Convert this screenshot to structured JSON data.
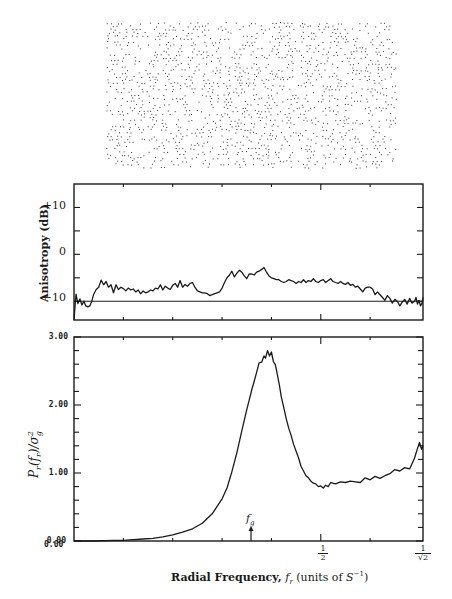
{
  "figure": {
    "pattern_panel": {
      "description": "blue-noise halftone dot pattern",
      "x": 106,
      "y": 22,
      "width": 290,
      "height": 148
    }
  },
  "chart_data": [
    {
      "type": "line",
      "title": "",
      "ylabel": "Anisotropy (dB)",
      "xlabel": "",
      "ylim": [
        -14,
        15
      ],
      "xlim": [
        0,
        0.7071
      ],
      "yticks": [
        -10,
        -5,
        0,
        5,
        10
      ],
      "ytick_labels": [
        "+10",
        "0",
        "-10"
      ],
      "reference_line": -10,
      "grid": false,
      "series": [
        {
          "name": "anisotropy",
          "x": [
            0.0,
            0.004,
            0.008,
            0.012,
            0.016,
            0.02,
            0.024,
            0.028,
            0.032,
            0.036,
            0.04,
            0.045,
            0.05,
            0.055,
            0.06,
            0.065,
            0.07,
            0.075,
            0.08,
            0.085,
            0.09,
            0.095,
            0.1,
            0.105,
            0.11,
            0.115,
            0.12,
            0.125,
            0.13,
            0.135,
            0.14,
            0.145,
            0.15,
            0.155,
            0.16,
            0.165,
            0.17,
            0.175,
            0.18,
            0.185,
            0.19,
            0.195,
            0.2,
            0.205,
            0.21,
            0.215,
            0.22,
            0.225,
            0.23,
            0.235,
            0.24,
            0.245,
            0.25,
            0.255,
            0.26,
            0.265,
            0.27,
            0.275,
            0.28,
            0.285,
            0.29,
            0.295,
            0.3,
            0.305,
            0.31,
            0.315,
            0.32,
            0.325,
            0.33,
            0.335,
            0.34,
            0.345,
            0.35,
            0.355,
            0.36,
            0.365,
            0.37,
            0.375,
            0.38,
            0.385,
            0.39,
            0.395,
            0.4,
            0.405,
            0.41,
            0.415,
            0.42,
            0.425,
            0.43,
            0.435,
            0.44,
            0.445,
            0.45,
            0.455,
            0.46,
            0.465,
            0.47,
            0.475,
            0.48,
            0.485,
            0.49,
            0.495,
            0.5,
            0.505,
            0.51,
            0.515,
            0.52,
            0.525,
            0.53,
            0.535,
            0.54,
            0.545,
            0.55,
            0.555,
            0.56,
            0.565,
            0.57,
            0.575,
            0.58,
            0.585,
            0.59,
            0.595,
            0.6,
            0.605,
            0.61,
            0.615,
            0.62,
            0.625,
            0.63,
            0.635,
            0.64,
            0.645,
            0.65,
            0.655,
            0.66,
            0.665,
            0.67,
            0.675,
            0.68,
            0.685,
            0.69,
            0.693,
            0.696,
            0.699,
            0.702,
            0.705,
            0.707
          ],
          "values": [
            -14,
            -8.5,
            -10.5,
            -9.5,
            -10.8,
            -10,
            -11,
            -11.2,
            -11,
            -10,
            -8.5,
            -7.5,
            -7,
            -5.5,
            -6.5,
            -5.8,
            -7,
            -6.5,
            -8.2,
            -6.5,
            -7.5,
            -7,
            -7.3,
            -7.8,
            -7.2,
            -7.6,
            -7.4,
            -8,
            -7.6,
            -8.4,
            -7.8,
            -8.2,
            -8,
            -7.6,
            -7.8,
            -7.2,
            -7.4,
            -6.5,
            -7.6,
            -6.8,
            -7.2,
            -7.5,
            -6.6,
            -6.2,
            -7,
            -5.6,
            -7,
            -6.4,
            -6.8,
            -6.2,
            -6,
            -7,
            -7.8,
            -8,
            -8.2,
            -8.2,
            -8.4,
            -8.8,
            -8.6,
            -8.4,
            -8.2,
            -8,
            -7.2,
            -6,
            -5,
            -4.4,
            -3.6,
            -4.8,
            -4,
            -3.4,
            -3.8,
            -4.6,
            -5.2,
            -4.2,
            -4.2,
            -4.4,
            -3.8,
            -3.6,
            -3.2,
            -2.8,
            -3.8,
            -4.6,
            -5,
            -5.2,
            -5.4,
            -5.4,
            -5.8,
            -6,
            -5.8,
            -5.4,
            -5.6,
            -5.8,
            -6.2,
            -5.8,
            -6,
            -5.4,
            -6,
            -5.6,
            -5.8,
            -5.2,
            -5.8,
            -6,
            -5.6,
            -5.4,
            -6,
            -5.6,
            -5.2,
            -5.8,
            -6,
            -6.2,
            -5.8,
            -6.2,
            -6.4,
            -6,
            -6.6,
            -6.4,
            -7,
            -6.8,
            -7.4,
            -8,
            -7.2,
            -7,
            -7,
            -7.4,
            -8.6,
            -8,
            -8.6,
            -9.2,
            -9.8,
            -8.8,
            -9.4,
            -10.4,
            -9.6,
            -10,
            -11,
            -10.2,
            -9.6,
            -10.6,
            -9.4,
            -10.4,
            -10,
            -9.2,
            -10.6,
            -9.8,
            -11,
            -10.4,
            -9.2,
            -12.2,
            -14,
            -9.6,
            -10.4,
            -8.8,
            -10,
            -14
          ]
        }
      ]
    },
    {
      "type": "line",
      "title": "",
      "ylabel": "P_r(f_r)/σ_g²",
      "xlabel": "Radial Frequency, f_r (units of S^-1)",
      "ylim": [
        0,
        3
      ],
      "xlim": [
        0,
        0.7071
      ],
      "yticks": [
        0,
        0.2,
        0.4,
        0.6,
        0.8,
        1.0,
        1.2,
        1.4,
        1.6,
        1.8,
        2.0,
        2.2,
        2.4,
        2.6,
        2.8,
        3.0
      ],
      "ytick_labels": [
        "0.00",
        "1.00",
        "2.00",
        "3.00"
      ],
      "xtick_labels": [
        "0.00",
        "1/2",
        "1/√2"
      ],
      "annotations": [
        {
          "text": "f_g",
          "x": 0.3901,
          "arrow": true
        }
      ],
      "grid": false,
      "series": [
        {
          "name": "radial power spectrum",
          "x": [
            0.0,
            0.04,
            0.08,
            0.1,
            0.12,
            0.14,
            0.16,
            0.18,
            0.2,
            0.22,
            0.24,
            0.26,
            0.28,
            0.3,
            0.31,
            0.32,
            0.33,
            0.34,
            0.35,
            0.355,
            0.36,
            0.365,
            0.37,
            0.375,
            0.38,
            0.385,
            0.388,
            0.392,
            0.396,
            0.4,
            0.404,
            0.408,
            0.412,
            0.416,
            0.42,
            0.425,
            0.43,
            0.435,
            0.44,
            0.445,
            0.45,
            0.455,
            0.46,
            0.465,
            0.47,
            0.475,
            0.48,
            0.485,
            0.49,
            0.495,
            0.5,
            0.505,
            0.51,
            0.515,
            0.52,
            0.53,
            0.54,
            0.55,
            0.56,
            0.57,
            0.58,
            0.59,
            0.6,
            0.61,
            0.62,
            0.63,
            0.64,
            0.65,
            0.66,
            0.67,
            0.68,
            0.69,
            0.695,
            0.7,
            0.704,
            0.707
          ],
          "values": [
            0.0,
            0.0,
            0.01,
            0.01,
            0.02,
            0.03,
            0.04,
            0.06,
            0.09,
            0.13,
            0.18,
            0.26,
            0.4,
            0.62,
            0.78,
            1.02,
            1.3,
            1.62,
            1.93,
            2.07,
            2.22,
            2.35,
            2.48,
            2.62,
            2.63,
            2.72,
            2.69,
            2.8,
            2.72,
            2.78,
            2.64,
            2.59,
            2.45,
            2.3,
            2.12,
            1.96,
            1.8,
            1.66,
            1.55,
            1.42,
            1.32,
            1.22,
            1.1,
            1.03,
            0.96,
            0.93,
            0.88,
            0.85,
            0.84,
            0.8,
            0.81,
            0.78,
            0.82,
            0.8,
            0.86,
            0.84,
            0.87,
            0.86,
            0.88,
            0.87,
            0.86,
            0.93,
            0.9,
            0.95,
            0.92,
            0.96,
            0.99,
            1.05,
            1.03,
            1.08,
            1.06,
            1.22,
            1.34,
            1.45,
            1.35,
            1.4
          ]
        }
      ]
    }
  ],
  "labels": {
    "top_ylabel": "Anisotropy (dB)",
    "top_yticks": {
      "p10": "+10",
      "zero": "0",
      "m10": "−10"
    },
    "bot_ylabel": "Pr(fr)/σg²",
    "bot_yticks": {
      "y0": "0.00",
      "y1": "1.00",
      "y2": "2.00",
      "y3": "3.00"
    },
    "bot_xtick0": "0.00",
    "half_num": "1",
    "half_den": "2",
    "root_num": "1",
    "root_den": "√2",
    "fg": "f",
    "fg_sub": "g",
    "xlabel_bold": "Radial Frequency, ",
    "xlabel_var": "f",
    "xlabel_var_sub": "r",
    "xlabel_units_pre": " (units of ",
    "xlabel_units_S": "S",
    "xlabel_units_exp": "−1",
    "xlabel_units_post": ")"
  }
}
